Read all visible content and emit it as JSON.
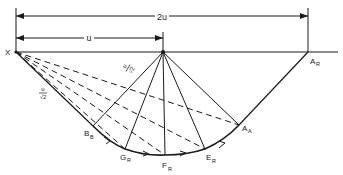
{
  "diagram": {
    "labels": {
      "dim_2u": "2u",
      "dim_u": "u",
      "origin": "X",
      "frac_num": "u",
      "frac_den": "√2",
      "points": [
        {
          "id": "A_R",
          "main": "A",
          "sub": "R"
        },
        {
          "id": "B_B",
          "main": "B",
          "sub": "B"
        },
        {
          "id": "G_R",
          "main": "G",
          "sub": "R"
        },
        {
          "id": "F_R",
          "main": "F",
          "sub": "R"
        },
        {
          "id": "E_R",
          "main": "E",
          "sub": "R"
        },
        {
          "id": "A_A",
          "main": "A",
          "sub": "A"
        }
      ]
    },
    "colors": {
      "stroke": "#1a1a1a",
      "background": "#ffffff"
    }
  }
}
